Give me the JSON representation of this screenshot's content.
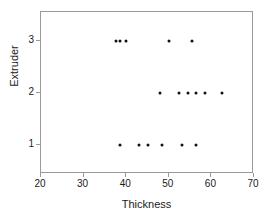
{
  "chart_data": {
    "type": "scatter",
    "title": "",
    "xlabel": "Thickness",
    "ylabel": "Extruder",
    "xlim": [
      20,
      70
    ],
    "ylim": [
      0.45,
      3.55
    ],
    "xticks": [
      20,
      30,
      40,
      50,
      60,
      70
    ],
    "yticks": [
      1,
      2,
      3
    ],
    "grid": false,
    "legend": false,
    "marker": "filled-circle",
    "marker_color": "#111111",
    "frame_color": "#9a9a9a",
    "background": "#ffffff",
    "series": [
      {
        "name": "Extruder 1",
        "y": 1,
        "x": [
          38.5,
          43.0,
          45.0,
          48.5,
          53.0,
          56.5
        ]
      },
      {
        "name": "Extruder 2",
        "y": 2,
        "x": [
          48.0,
          52.5,
          54.5,
          56.5,
          58.5,
          62.5
        ]
      },
      {
        "name": "Extruder 3",
        "y": 3,
        "x": [
          37.5,
          38.5,
          40.0,
          50.0,
          55.5
        ]
      }
    ],
    "points": [
      {
        "x": 38.5,
        "y": 1
      },
      {
        "x": 43.0,
        "y": 1
      },
      {
        "x": 45.0,
        "y": 1
      },
      {
        "x": 48.5,
        "y": 1
      },
      {
        "x": 53.0,
        "y": 1
      },
      {
        "x": 56.5,
        "y": 1
      },
      {
        "x": 48.0,
        "y": 2
      },
      {
        "x": 52.5,
        "y": 2
      },
      {
        "x": 54.5,
        "y": 2
      },
      {
        "x": 56.5,
        "y": 2
      },
      {
        "x": 58.5,
        "y": 2
      },
      {
        "x": 62.5,
        "y": 2
      },
      {
        "x": 37.5,
        "y": 3
      },
      {
        "x": 38.5,
        "y": 3
      },
      {
        "x": 40.0,
        "y": 3
      },
      {
        "x": 50.0,
        "y": 3
      },
      {
        "x": 55.5,
        "y": 3
      }
    ]
  },
  "axes": {
    "x_title": "Thickness",
    "y_title": "Extruder",
    "x_tick_labels": [
      "20",
      "30",
      "40",
      "50",
      "60",
      "70"
    ],
    "y_tick_labels": [
      "1",
      "2",
      "3"
    ]
  }
}
